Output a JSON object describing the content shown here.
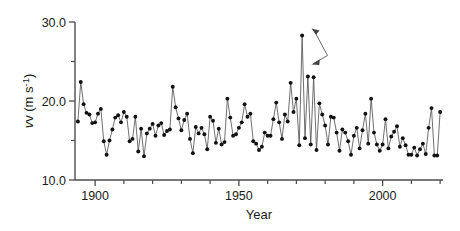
{
  "figure": {
    "background_color": "#ffffff",
    "line_color": "#555555",
    "marker_color": "#111111",
    "axis_color": "#4d4d4d"
  },
  "axes": {
    "x_title": "Year",
    "y_title_prefix": "v (m s",
    "y_title_exponent": "-1",
    "y_title_suffix": ")",
    "x_major_labels": [
      "1900",
      "1950",
      "2000"
    ],
    "y_major_labels": [
      "10.0",
      "20.0",
      "30.0"
    ]
  },
  "annotation": {
    "name": "peak-double-arrow",
    "label": ""
  },
  "chart_data": {
    "type": "line",
    "title": "",
    "xlabel": "Year",
    "ylabel": "v (m s^-1)",
    "xlim": [
      1893,
      2021
    ],
    "ylim": [
      10.0,
      30.0
    ],
    "x_major_ticks": [
      1900,
      1950,
      2000
    ],
    "x_minor_tick_interval": 10,
    "y_major_ticks": [
      10.0,
      20.0,
      30.0
    ],
    "y_minor_ticks": [
      15.0,
      25.0
    ],
    "grid": false,
    "legend": "none",
    "markers": "filled-circle",
    "series": [
      {
        "name": "annual maximum wind speed",
        "x": [
          1894,
          1895,
          1896,
          1897,
          1898,
          1899,
          1900,
          1901,
          1902,
          1903,
          1904,
          1905,
          1906,
          1907,
          1908,
          1909,
          1910,
          1911,
          1912,
          1913,
          1914,
          1915,
          1916,
          1917,
          1918,
          1919,
          1920,
          1921,
          1922,
          1923,
          1924,
          1925,
          1926,
          1927,
          1928,
          1929,
          1930,
          1931,
          1932,
          1933,
          1934,
          1935,
          1936,
          1937,
          1938,
          1939,
          1940,
          1941,
          1942,
          1943,
          1944,
          1945,
          1946,
          1947,
          1948,
          1949,
          1950,
          1951,
          1952,
          1953,
          1954,
          1955,
          1956,
          1957,
          1958,
          1959,
          1960,
          1961,
          1962,
          1963,
          1964,
          1965,
          1966,
          1967,
          1968,
          1969,
          1970,
          1971,
          1972,
          1973,
          1974,
          1975,
          1976,
          1977,
          1978,
          1979,
          1980,
          1981,
          1982,
          1983,
          1984,
          1985,
          1986,
          1987,
          1988,
          1989,
          1990,
          1991,
          1992,
          1993,
          1994,
          1995,
          1996,
          1997,
          1998,
          1999,
          2000,
          2001,
          2002,
          2003,
          2004,
          2005,
          2006,
          2007,
          2008,
          2009,
          2010,
          2011,
          2012,
          2013,
          2014,
          2015,
          2016,
          2017,
          2018,
          2019,
          2020
        ],
        "y": [
          17.4,
          22.4,
          19.6,
          18.5,
          18.3,
          17.2,
          17.3,
          18.4,
          19.0,
          14.9,
          13.2,
          15.0,
          16.4,
          17.9,
          18.2,
          17.3,
          18.6,
          18.0,
          14.9,
          15.2,
          18.0,
          13.6,
          16.5,
          13.0,
          15.9,
          16.5,
          17.1,
          15.6,
          16.9,
          17.2,
          15.7,
          16.2,
          16.4,
          21.8,
          19.2,
          17.8,
          16.3,
          17.6,
          18.4,
          15.2,
          13.4,
          16.7,
          15.9,
          16.6,
          15.8,
          13.9,
          18.0,
          17.5,
          14.7,
          16.5,
          14.5,
          14.8,
          20.3,
          17.9,
          15.6,
          15.8,
          16.6,
          17.3,
          19.6,
          18.0,
          18.4,
          14.9,
          14.6,
          13.8,
          14.2,
          16.0,
          15.6,
          15.6,
          17.7,
          19.8,
          17.3,
          15.2,
          18.3,
          17.4,
          22.3,
          18.6,
          20.3,
          14.4,
          28.3,
          15.3,
          23.1,
          14.5,
          23.0,
          13.8,
          19.7,
          18.3,
          16.9,
          14.5,
          18.0,
          17.9,
          16.0,
          13.7,
          16.4,
          16.0,
          14.9,
          13.2,
          15.6,
          16.6,
          14.0,
          16.3,
          18.4,
          14.6,
          20.3,
          16.0,
          14.5,
          13.7,
          14.5,
          17.7,
          14.0,
          15.5,
          16.1,
          16.8,
          14.2,
          15.3,
          14.4,
          13.2,
          13.2,
          14.1,
          13.1,
          13.9,
          14.6,
          13.3,
          16.6,
          19.1,
          13.1,
          13.1,
          18.6
        ]
      }
    ]
  }
}
